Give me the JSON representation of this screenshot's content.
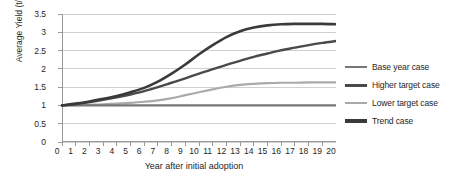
{
  "chart_data": {
    "type": "line",
    "title": "",
    "xlabel": "Year after initial adoption",
    "ylabel": "Average Yield (t/ha)",
    "xlim": [
      0,
      20
    ],
    "ylim": [
      0,
      3.5
    ],
    "ytick_step": 0.5,
    "grid": true,
    "legend_position": "right",
    "x": [
      0,
      1,
      2,
      3,
      4,
      5,
      6,
      7,
      8,
      9,
      10,
      11,
      12,
      13,
      14,
      15,
      16,
      17,
      18,
      19,
      20
    ],
    "xticklabels": [
      "0",
      "1",
      "2",
      "3",
      "4",
      "5",
      "6",
      "7",
      "8",
      "9",
      "10",
      "11",
      "12",
      "13",
      "14",
      "15",
      "16",
      "17",
      "18",
      "19",
      "20"
    ],
    "yticklabels": [
      "0",
      "0.5",
      "1",
      "1.5",
      "2",
      "2.5",
      "3",
      "3.5"
    ],
    "yticks": [
      0,
      0.5,
      1,
      1.5,
      2,
      2.5,
      3,
      3.5
    ],
    "series": [
      {
        "name": "Base year case",
        "color": "#767676",
        "width": 2.2,
        "values": [
          1.0,
          1.0,
          1.0,
          1.0,
          1.0,
          1.0,
          1.0,
          1.0,
          1.0,
          1.0,
          1.0,
          1.0,
          1.0,
          1.0,
          1.0,
          1.0,
          1.0,
          1.0,
          1.0,
          1.0,
          1.0
        ]
      },
      {
        "name": "Higher target case",
        "color": "#4a4a4a",
        "width": 2.4,
        "values": [
          1.0,
          1.04,
          1.09,
          1.15,
          1.22,
          1.3,
          1.39,
          1.5,
          1.62,
          1.74,
          1.87,
          1.99,
          2.11,
          2.22,
          2.33,
          2.42,
          2.51,
          2.58,
          2.65,
          2.71,
          2.76
        ]
      },
      {
        "name": "Lower target case",
        "color": "#aaaaaa",
        "width": 2.2,
        "values": [
          1.0,
          1.01,
          1.02,
          1.03,
          1.05,
          1.07,
          1.1,
          1.14,
          1.2,
          1.28,
          1.36,
          1.44,
          1.51,
          1.56,
          1.59,
          1.61,
          1.62,
          1.62,
          1.63,
          1.63,
          1.63
        ]
      },
      {
        "name": "Trend case",
        "color": "#3a3a3a",
        "width": 2.6,
        "values": [
          1.0,
          1.05,
          1.11,
          1.18,
          1.26,
          1.36,
          1.48,
          1.65,
          1.87,
          2.12,
          2.4,
          2.65,
          2.87,
          3.03,
          3.13,
          3.19,
          3.22,
          3.23,
          3.23,
          3.23,
          3.22
        ]
      }
    ]
  },
  "axes": {
    "y_title": "Average Yield (t/ha)",
    "x_title": "Year after initial adoption"
  },
  "legend": {
    "items": [
      {
        "label": "Base year case"
      },
      {
        "label": "Higher target case"
      },
      {
        "label": "Lower target case"
      },
      {
        "label": "Trend case"
      }
    ]
  }
}
